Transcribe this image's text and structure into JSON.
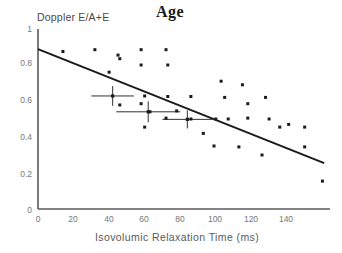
{
  "chart_data": {
    "type": "scatter",
    "title": "Age",
    "xlabel": "Isovolumic Relaxation Time (ms)",
    "ylabel": "Doppler E/A+E",
    "xlim": [
      0,
      162
    ],
    "ylim": [
      0,
      1
    ],
    "xticks": [
      0,
      20,
      40,
      60,
      80,
      100,
      120,
      140
    ],
    "xticklabels": [
      "0",
      "20",
      "40",
      "60",
      "80",
      "100",
      "120",
      "140"
    ],
    "yticks": [
      0,
      0.2,
      0.4,
      0.6,
      0.8,
      1
    ],
    "yticklabels": [
      "0",
      "0.2",
      "0.4",
      "0.6",
      "0.8",
      "1"
    ],
    "grid": false,
    "legend": null,
    "marker_color": "#1a1a1a",
    "line_color": "#1a1a1a",
    "axis_color": "#555555",
    "points": [
      {
        "x": 14,
        "y": 0.875
      },
      {
        "x": 32,
        "y": 0.885
      },
      {
        "x": 45,
        "y": 0.855
      },
      {
        "x": 46,
        "y": 0.835
      },
      {
        "x": 58,
        "y": 0.885
      },
      {
        "x": 58,
        "y": 0.8
      },
      {
        "x": 72,
        "y": 0.885
      },
      {
        "x": 73,
        "y": 0.8
      },
      {
        "x": 40,
        "y": 0.76
      },
      {
        "x": 60,
        "y": 0.628
      },
      {
        "x": 73,
        "y": 0.625
      },
      {
        "x": 86,
        "y": 0.625
      },
      {
        "x": 58,
        "y": 0.585
      },
      {
        "x": 46,
        "y": 0.578
      },
      {
        "x": 63,
        "y": 0.54
      },
      {
        "x": 78,
        "y": 0.545
      },
      {
        "x": 72,
        "y": 0.505
      },
      {
        "x": 86,
        "y": 0.5
      },
      {
        "x": 93,
        "y": 0.42
      },
      {
        "x": 60,
        "y": 0.455
      },
      {
        "x": 103,
        "y": 0.71
      },
      {
        "x": 115,
        "y": 0.69
      },
      {
        "x": 105,
        "y": 0.62
      },
      {
        "x": 118,
        "y": 0.585
      },
      {
        "x": 128,
        "y": 0.62
      },
      {
        "x": 107,
        "y": 0.5
      },
      {
        "x": 118,
        "y": 0.505
      },
      {
        "x": 130,
        "y": 0.5
      },
      {
        "x": 141,
        "y": 0.47
      },
      {
        "x": 100,
        "y": 0.5
      },
      {
        "x": 99,
        "y": 0.35
      },
      {
        "x": 113,
        "y": 0.345
      },
      {
        "x": 126,
        "y": 0.3
      },
      {
        "x": 136,
        "y": 0.455
      },
      {
        "x": 150,
        "y": 0.455
      },
      {
        "x": 150,
        "y": 0.345
      },
      {
        "x": 160,
        "y": 0.155
      }
    ],
    "errorbars": [
      {
        "x": 42,
        "y": 0.628,
        "xerr": 12,
        "yerr": 0.055,
        "label": "group-1-mean"
      },
      {
        "x": 62,
        "y": 0.54,
        "xerr": 18,
        "yerr": 0.058,
        "label": "group-2-mean"
      },
      {
        "x": 84,
        "y": 0.498,
        "xerr": 14,
        "yerr": 0.05,
        "label": "group-3-mean"
      }
    ],
    "regression_line": {
      "x0": 0,
      "y0": 0.888,
      "x1": 161,
      "y1": 0.255
    }
  }
}
